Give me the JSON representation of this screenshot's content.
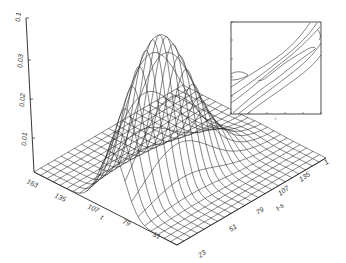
{
  "chart_data": {
    "type": "surface3d",
    "title": "",
    "zlabel": "",
    "z_ticks": [
      "0.01",
      "0.02",
      "0.03",
      "0.1"
    ],
    "zlim": [
      0,
      0.04
    ],
    "x_axis": {
      "label": "t",
      "ticks": [
        "163",
        "135",
        "107",
        "79",
        "51"
      ]
    },
    "y_axis": {
      "label": "t-s",
      "ticks": [
        "23",
        "51",
        "79",
        "107",
        "135",
        "1"
      ]
    },
    "grid": false,
    "surface": {
      "description": "Wireframe mesh of a single peaked ridge (Gaussian-like) rising from a flat plane; peak near t~79-107, t-s~107-135, max z ~0.04",
      "peak_z": 0.04
    },
    "inset": {
      "type": "contour",
      "xlabel": "t",
      "ylabel": "",
      "description": "Contour plot with diagonal elongated contours along the t = t-s direction",
      "x_tick_count": 6,
      "y_tick_count": 6
    }
  }
}
